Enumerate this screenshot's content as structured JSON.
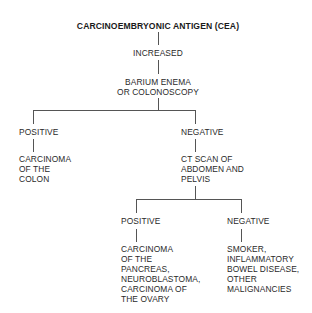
{
  "diagram": {
    "title": "CARCINOEMBRYONIC ANTIGEN (CEA)",
    "level1": "INCREASED",
    "level2": "BARIUM ENEMA\nOR COLONOSCOPY",
    "branch_left": {
      "label": "POSITIVE",
      "result": "CARCINOMA\nOF THE\nCOLON"
    },
    "branch_right": {
      "label": "NEGATIVE",
      "result": "CT SCAN OF\nABDOMEN AND\nPELVIS",
      "sub_left": {
        "label": "POSITIVE",
        "result": "CARCINOMA\nOF THE\nPANCREAS,\nNEUROBLASTOMA,\nCARCINOMA OF\nTHE OVARY"
      },
      "sub_right": {
        "label": "NEGATIVE",
        "result": "SMOKER,\nINFLAMMATORY\nBOWEL DISEASE,\nOTHER\nMALIGNANCIES"
      }
    }
  },
  "colors": {
    "text": "#2a2a2a",
    "lines": "#555555",
    "background": "#ffffff"
  }
}
